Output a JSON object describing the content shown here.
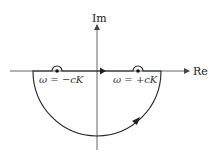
{
  "diagram": {
    "type": "nyquist-contour",
    "axes": {
      "real_label": "Re",
      "imag_label": "Im"
    },
    "indentations": [
      {
        "label_prefix": "ω = ",
        "label_value": "−cK",
        "side": "left"
      },
      {
        "label_prefix": "ω = ",
        "label_value": "+cK",
        "side": "right"
      }
    ],
    "labels": {
      "left_pole": "ω = −cK",
      "right_pole": "ω = +cK"
    },
    "direction": "clockwise",
    "colors": {
      "contour": "#222222",
      "axis": "#555555",
      "background": "#ffffff"
    }
  }
}
